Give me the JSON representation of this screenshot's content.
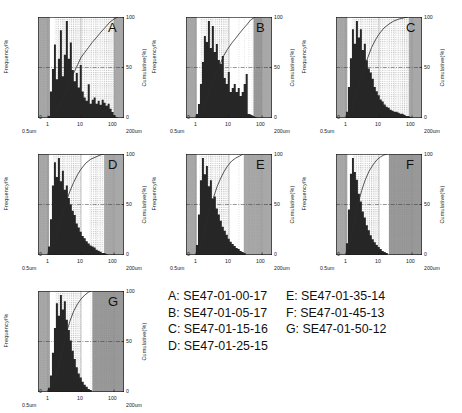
{
  "figure": {
    "axis": {
      "ylabel_left": "Frequency/%",
      "ylabel_right": "Cumulative(%)",
      "x_ticks": [
        "1",
        "10",
        "100"
      ],
      "x_range_left": "0.5um",
      "x_range_right": "200um",
      "y_left_ticks": [
        "0"
      ],
      "y_right_ticks": [
        "100",
        "50",
        "0"
      ]
    },
    "colors": {
      "bars": "#262626",
      "curve": "#2b2b2b",
      "band_gray": "#a8a8a8",
      "band_gray_dark": "#9a9a9a",
      "grid_dot": "#8c8c8c",
      "axis": "#1a1a1a",
      "background": "#ffffff"
    }
  },
  "legend": {
    "col1": [
      "A: SE47-01-00-17",
      "B: SE47-01-05-17",
      "C: SE47-01-15-16",
      "D: SE47-01-25-15"
    ],
    "col2": [
      "E: SE47-01-35-14",
      "F: SE47-01-45-13",
      "G: SE47-01-50-12"
    ]
  },
  "chart_data": {
    "type": "bar",
    "title": "",
    "xlabel": "Particle diameter (um)",
    "ylabel": "Frequency/%",
    "ylabel2": "Cumulative(%)",
    "xscale": "log",
    "xlim": [
      0.5,
      200
    ],
    "ylim": [
      0,
      100
    ],
    "ylim2": [
      0,
      100
    ],
    "grid": true,
    "legend_position": "bottom-right",
    "x_tick_values": [
      1,
      10,
      100
    ],
    "panels": [
      {
        "id": "A",
        "sample": "SE47-01-00-17",
        "bands": [
          {
            "from": 0.5,
            "to": 1.15,
            "shade": "gray"
          },
          {
            "from": 1.15,
            "to": 1.6,
            "shade": "white"
          },
          {
            "from": 1.6,
            "to": 10.0,
            "shade": "dotted"
          },
          {
            "from": 10.0,
            "to": 100.0,
            "shade": "dotted"
          },
          {
            "from": 100.0,
            "to": 200.0,
            "shade": "gray"
          }
        ],
        "bins": [
          1.0,
          1.15,
          1.32,
          1.52,
          1.74,
          2.0,
          2.3,
          2.64,
          3.03,
          3.48,
          4.0,
          4.6,
          5.28,
          6.06,
          6.96,
          8.0,
          9.19,
          10.55,
          12.1,
          13.9,
          16.0,
          18.4,
          21.1,
          24.2,
          27.8,
          32.0,
          36.8,
          42.2,
          48.5,
          55.7,
          64.0,
          73.5,
          84.4,
          96.9,
          111.3
        ],
        "frequencies": [
          2,
          26,
          48,
          72,
          38,
          58,
          86,
          41,
          62,
          95,
          58,
          74,
          47,
          36,
          44,
          30,
          52,
          26,
          20,
          17,
          33,
          14,
          18,
          20,
          14,
          17,
          13,
          18,
          15,
          12,
          14,
          9,
          6,
          3,
          1
        ],
        "cumulative_x": [
          1.0,
          1.5,
          2.0,
          3.0,
          4.0,
          5.0,
          6.5,
          8.0,
          10.0,
          13.0,
          17.0,
          22.0,
          30.0,
          40.0,
          55.0,
          75.0,
          100.0,
          130.0
        ],
        "cumulative_y": [
          0,
          4,
          10,
          20,
          31,
          39,
          47,
          53,
          60,
          65,
          70,
          75,
          80,
          85,
          90,
          95,
          98,
          100
        ]
      },
      {
        "id": "B",
        "sample": "SE47-01-05-17",
        "bands": [
          {
            "from": 0.5,
            "to": 1.05,
            "shade": "gray"
          },
          {
            "from": 1.05,
            "to": 1.35,
            "shade": "white"
          },
          {
            "from": 1.35,
            "to": 10.0,
            "shade": "dotted"
          },
          {
            "from": 10.0,
            "to": 55.0,
            "shade": "white"
          },
          {
            "from": 55.0,
            "to": 100.0,
            "shade": "dotted-dark"
          },
          {
            "from": 100.0,
            "to": 200.0,
            "shade": "gray"
          }
        ],
        "bins": [
          1.0,
          1.15,
          1.32,
          1.52,
          1.74,
          2.0,
          2.3,
          2.64,
          3.03,
          3.48,
          4.0,
          4.6,
          5.28,
          6.06,
          6.96,
          8.0,
          9.19,
          10.55,
          12.1,
          13.9,
          16.0,
          18.4,
          21.1,
          24.2,
          27.8,
          32.0,
          36.8,
          42.2,
          48.5,
          55.7,
          64.0
        ],
        "frequencies": [
          4,
          14,
          34,
          56,
          82,
          76,
          97,
          70,
          92,
          66,
          74,
          58,
          54,
          62,
          40,
          34,
          46,
          26,
          30,
          34,
          26,
          30,
          22,
          26,
          34,
          44,
          4
        ],
        "cumulative_x": [
          1.0,
          1.5,
          2.0,
          3.0,
          4.0,
          5.5,
          7.0,
          9.0,
          12.0,
          16.0,
          21.0,
          28.0,
          36.0,
          45.0,
          55.0,
          62.0
        ],
        "cumulative_y": [
          0,
          7,
          17,
          32,
          44,
          54,
          62,
          68,
          74,
          79,
          84,
          89,
          93,
          97,
          99,
          100
        ]
      },
      {
        "id": "C",
        "sample": "SE47-01-15-16",
        "bands": [
          {
            "from": 0.5,
            "to": 1.1,
            "shade": "gray"
          },
          {
            "from": 1.1,
            "to": 1.5,
            "shade": "white"
          },
          {
            "from": 1.5,
            "to": 10.0,
            "shade": "dotted"
          },
          {
            "from": 10.0,
            "to": 80.0,
            "shade": "dotted"
          },
          {
            "from": 80.0,
            "to": 200.0,
            "shade": "gray"
          }
        ],
        "bins": [
          1.0,
          1.15,
          1.32,
          1.52,
          1.74,
          2.0,
          2.3,
          2.64,
          3.03,
          3.48,
          4.0,
          4.6,
          5.28,
          6.06,
          6.96,
          8.0,
          9.19,
          10.55,
          12.1,
          13.9,
          16.0,
          18.4,
          21.1,
          24.2,
          27.8,
          32.0,
          36.8,
          42.2,
          48.5,
          55.7,
          64.0,
          73.5,
          84.4
        ],
        "frequencies": [
          6,
          30,
          58,
          86,
          72,
          94,
          78,
          86,
          66,
          72,
          56,
          48,
          44,
          38,
          30,
          26,
          22,
          18,
          16,
          13,
          11,
          10,
          8,
          7,
          6,
          6,
          5,
          4,
          4,
          3,
          2,
          2,
          1
        ],
        "cumulative_x": [
          1.0,
          1.5,
          2.0,
          2.8,
          3.6,
          4.6,
          6.0,
          8.0,
          10.0,
          14.0,
          20.0,
          28.0,
          40.0,
          55.0,
          75.0
        ],
        "cumulative_y": [
          0,
          9,
          23,
          38,
          50,
          60,
          70,
          78,
          83,
          89,
          93,
          96,
          98,
          99,
          100
        ]
      },
      {
        "id": "D",
        "sample": "SE47-01-25-15",
        "bands": [
          {
            "from": 0.5,
            "to": 1.08,
            "shade": "gray"
          },
          {
            "from": 1.08,
            "to": 1.45,
            "shade": "white"
          },
          {
            "from": 1.45,
            "to": 10.0,
            "shade": "dotted"
          },
          {
            "from": 10.0,
            "to": 18.0,
            "shade": "white"
          },
          {
            "from": 18.0,
            "to": 50.0,
            "shade": "dotted"
          },
          {
            "from": 50.0,
            "to": 100.0,
            "shade": "gray"
          },
          {
            "from": 100.0,
            "to": 200.0,
            "shade": "gray"
          }
        ],
        "bins": [
          1.0,
          1.15,
          1.32,
          1.52,
          1.74,
          2.0,
          2.3,
          2.64,
          3.03,
          3.48,
          4.0,
          4.6,
          5.28,
          6.06,
          6.96,
          8.0,
          9.19,
          10.55,
          12.1,
          13.9,
          16.0,
          18.4,
          21.1,
          24.2,
          27.8,
          32.0,
          36.8,
          42.2,
          48.5,
          55.7
        ],
        "frequencies": [
          8,
          34,
          66,
          88,
          74,
          92,
          70,
          80,
          62,
          66,
          54,
          48,
          42,
          38,
          30,
          26,
          22,
          18,
          16,
          13,
          11,
          9,
          8,
          7,
          5,
          4,
          3,
          2,
          2,
          1
        ],
        "cumulative_x": [
          1.0,
          1.5,
          2.0,
          2.8,
          3.6,
          4.6,
          6.0,
          8.0,
          10.0,
          14.0,
          20.0,
          28.0,
          38.0,
          50.0
        ],
        "cumulative_y": [
          0,
          10,
          25,
          41,
          53,
          63,
          72,
          80,
          85,
          91,
          95,
          97,
          99,
          100
        ]
      },
      {
        "id": "E",
        "sample": "SE47-01-35-14",
        "bands": [
          {
            "from": 0.5,
            "to": 1.05,
            "shade": "gray"
          },
          {
            "from": 1.05,
            "to": 1.3,
            "shade": "white"
          },
          {
            "from": 1.3,
            "to": 10.0,
            "shade": "dotted"
          },
          {
            "from": 10.0,
            "to": 28.0,
            "shade": "white"
          },
          {
            "from": 28.0,
            "to": 100.0,
            "shade": "gray"
          },
          {
            "from": 100.0,
            "to": 200.0,
            "shade": "gray"
          }
        ],
        "bins": [
          1.0,
          1.15,
          1.32,
          1.52,
          1.74,
          2.0,
          2.3,
          2.64,
          3.03,
          3.48,
          4.0,
          4.6,
          5.28,
          6.06,
          6.96,
          8.0,
          9.19,
          10.55,
          12.1,
          13.9,
          16.0,
          18.4,
          21.1,
          24.2,
          27.8
        ],
        "frequencies": [
          10,
          40,
          74,
          96,
          80,
          88,
          68,
          74,
          56,
          58,
          46,
          40,
          34,
          28,
          24,
          20,
          16,
          13,
          11,
          9,
          7,
          6,
          4,
          3,
          2
        ],
        "cumulative_x": [
          1.0,
          1.5,
          2.0,
          2.6,
          3.4,
          4.4,
          5.6,
          7.2,
          9.0,
          12.0,
          16.0,
          21.0,
          27.0
        ],
        "cumulative_y": [
          0,
          12,
          29,
          44,
          57,
          68,
          76,
          83,
          88,
          93,
          96,
          98,
          100
        ]
      },
      {
        "id": "F",
        "sample": "SE47-01-45-13",
        "bands": [
          {
            "from": 0.5,
            "to": 1.1,
            "shade": "gray"
          },
          {
            "from": 1.1,
            "to": 1.6,
            "shade": "white"
          },
          {
            "from": 1.6,
            "to": 10.0,
            "shade": "dotted"
          },
          {
            "from": 10.0,
            "to": 20.0,
            "shade": "white"
          },
          {
            "from": 20.0,
            "to": 200.0,
            "shade": "dotted-dark"
          }
        ],
        "bins": [
          1.0,
          1.15,
          1.32,
          1.52,
          1.74,
          2.0,
          2.3,
          2.64,
          3.03,
          3.48,
          4.0,
          4.6,
          5.28,
          6.06,
          6.96,
          8.0,
          9.19,
          10.55,
          12.1,
          13.9,
          16.0
        ],
        "frequencies": [
          12,
          46,
          82,
          98,
          84,
          76,
          62,
          54,
          44,
          38,
          30,
          25,
          20,
          16,
          13,
          10,
          8,
          6,
          4,
          3,
          2
        ],
        "cumulative_x": [
          1.0,
          1.4,
          1.8,
          2.3,
          3.0,
          3.8,
          5.0,
          6.5,
          8.5,
          11.0,
          14.0,
          18.0
        ],
        "cumulative_y": [
          0,
          14,
          33,
          50,
          64,
          74,
          83,
          89,
          94,
          97,
          99,
          100
        ]
      },
      {
        "id": "G",
        "sample": "SE47-01-50-12",
        "bands": [
          {
            "from": 0.5,
            "to": 1.15,
            "shade": "gray"
          },
          {
            "from": 1.15,
            "to": 1.7,
            "shade": "white"
          },
          {
            "from": 1.7,
            "to": 10.0,
            "shade": "dotted"
          },
          {
            "from": 10.0,
            "to": 22.0,
            "shade": "white"
          },
          {
            "from": 22.0,
            "to": 200.0,
            "shade": "dotted-dark"
          }
        ],
        "bins": [
          1.0,
          1.15,
          1.32,
          1.52,
          1.74,
          2.0,
          2.3,
          2.64,
          3.03,
          3.48,
          4.0,
          4.6,
          5.28,
          6.06,
          6.96,
          8.0,
          9.19,
          10.55,
          12.1,
          13.9,
          16.0,
          18.4
        ],
        "frequencies": [
          4,
          16,
          38,
          62,
          86,
          74,
          94,
          80,
          88,
          70,
          60,
          50,
          40,
          32,
          24,
          18,
          14,
          10,
          7,
          5,
          3,
          2
        ],
        "cumulative_x": [
          1.0,
          1.6,
          2.2,
          2.8,
          3.6,
          4.6,
          6.0,
          7.8,
          10.0,
          13.0,
          17.0,
          21.0
        ],
        "cumulative_y": [
          0,
          12,
          28,
          44,
          58,
          70,
          80,
          87,
          92,
          96,
          99,
          100
        ]
      }
    ]
  }
}
